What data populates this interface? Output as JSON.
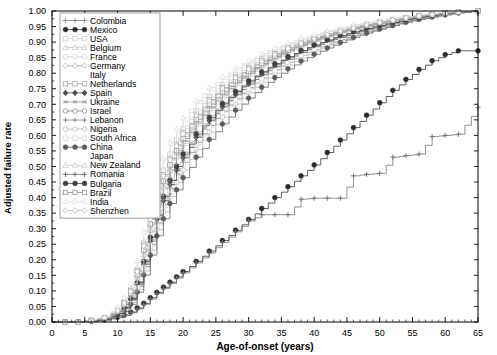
{
  "chart_data": {
    "type": "line",
    "title": "",
    "subtitle": "",
    "xlabel": "Age-of-onset (years)",
    "ylabel": "Adjusted failure rate",
    "xlim": [
      0,
      65
    ],
    "ylim": [
      0.0,
      1.0
    ],
    "xticks": [
      0,
      5,
      10,
      15,
      20,
      25,
      30,
      35,
      40,
      45,
      50,
      55,
      60,
      65
    ],
    "xtick_labels": [
      "0",
      "5",
      "10",
      "15",
      "20",
      "25",
      "30",
      "35",
      "40",
      "45",
      "50",
      "55",
      "60",
      "65"
    ],
    "yticks": [
      0.0,
      0.05,
      0.1,
      0.15,
      0.2,
      0.25,
      0.3,
      0.35,
      0.4,
      0.45,
      0.5,
      0.55,
      0.6,
      0.65,
      0.7,
      0.75,
      0.8,
      0.85,
      0.9,
      0.95,
      1.0
    ],
    "ytick_labels": [
      "0.00",
      "0.05",
      "0.10",
      "0.15",
      "0.20",
      "0.25",
      "0.30",
      "0.35",
      "0.40",
      "0.45",
      "0.50",
      "0.55",
      "0.60",
      "0.65",
      "0.70",
      "0.75",
      "0.80",
      "0.85",
      "0.90",
      "0.95",
      "1.00"
    ],
    "grid": false,
    "minor_ticks": true,
    "legend_position": "upper-left",
    "step_style": "post",
    "x": [
      0,
      2,
      4,
      6,
      8,
      10,
      11,
      12,
      13,
      14,
      15,
      16,
      17,
      18,
      19,
      20,
      22,
      24,
      26,
      28,
      30,
      32,
      34,
      36,
      38,
      40,
      42,
      44,
      46,
      48,
      50,
      52,
      54,
      56,
      58,
      60,
      62,
      65
    ],
    "series": [
      {
        "name": "Colombia",
        "marker": "plus",
        "color": "#8a8a8a",
        "values": [
          0,
          0,
          0,
          0.005,
          0.012,
          0.03,
          0.05,
          0.08,
          0.13,
          0.2,
          0.29,
          0.37,
          0.43,
          0.49,
          0.54,
          0.58,
          0.64,
          0.69,
          0.73,
          0.77,
          0.8,
          0.83,
          0.855,
          0.875,
          0.893,
          0.909,
          0.923,
          0.935,
          0.946,
          0.955,
          0.963,
          0.97,
          0.977,
          0.983,
          0.988,
          0.992,
          0.996,
          1.0
        ]
      },
      {
        "name": "Mexico",
        "marker": "filled-circle",
        "color": "#2b2b2b",
        "values": [
          0,
          0,
          0,
          0.003,
          0.007,
          0.015,
          0.022,
          0.032,
          0.045,
          0.06,
          0.078,
          0.095,
          0.112,
          0.128,
          0.145,
          0.162,
          0.195,
          0.228,
          0.262,
          0.295,
          0.33,
          0.365,
          0.4,
          0.435,
          0.47,
          0.505,
          0.545,
          0.585,
          0.625,
          0.665,
          0.705,
          0.745,
          0.78,
          0.812,
          0.84,
          0.86,
          0.872,
          0.872
        ]
      },
      {
        "name": "USA",
        "marker": "open-square",
        "color": "#c9c9c9",
        "values": [
          0,
          0,
          0,
          0.006,
          0.015,
          0.04,
          0.065,
          0.105,
          0.17,
          0.255,
          0.345,
          0.425,
          0.488,
          0.54,
          0.585,
          0.622,
          0.68,
          0.724,
          0.762,
          0.795,
          0.822,
          0.846,
          0.868,
          0.887,
          0.903,
          0.917,
          0.929,
          0.94,
          0.95,
          0.958,
          0.966,
          0.973,
          0.979,
          0.985,
          0.99,
          0.994,
          0.997,
          1.0
        ]
      },
      {
        "name": "Belgium",
        "marker": "open-triangle",
        "color": "#bdbdbd",
        "values": [
          0,
          0,
          0,
          0.005,
          0.013,
          0.036,
          0.058,
          0.094,
          0.155,
          0.235,
          0.32,
          0.398,
          0.46,
          0.512,
          0.558,
          0.596,
          0.656,
          0.703,
          0.743,
          0.778,
          0.807,
          0.833,
          0.856,
          0.876,
          0.894,
          0.909,
          0.922,
          0.934,
          0.945,
          0.954,
          0.962,
          0.97,
          0.977,
          0.983,
          0.988,
          0.993,
          0.996,
          1.0
        ]
      },
      {
        "name": "France",
        "marker": "open-circle",
        "color": "#cfcfcf",
        "values": [
          0,
          0,
          0,
          0.004,
          0.011,
          0.03,
          0.05,
          0.082,
          0.138,
          0.212,
          0.293,
          0.368,
          0.43,
          0.482,
          0.528,
          0.567,
          0.63,
          0.68,
          0.722,
          0.76,
          0.791,
          0.819,
          0.843,
          0.865,
          0.884,
          0.901,
          0.915,
          0.928,
          0.939,
          0.949,
          0.958,
          0.966,
          0.974,
          0.981,
          0.987,
          0.992,
          0.996,
          1.0
        ]
      },
      {
        "name": "Germany",
        "marker": "open-diamond",
        "color": "#a8a8a8",
        "values": [
          0,
          0,
          0,
          0.005,
          0.013,
          0.033,
          0.055,
          0.09,
          0.148,
          0.225,
          0.308,
          0.384,
          0.446,
          0.498,
          0.544,
          0.583,
          0.644,
          0.693,
          0.734,
          0.77,
          0.8,
          0.827,
          0.85,
          0.871,
          0.889,
          0.905,
          0.919,
          0.931,
          0.942,
          0.952,
          0.96,
          0.968,
          0.975,
          0.982,
          0.988,
          0.993,
          0.996,
          1.0
        ]
      },
      {
        "name": "Italy",
        "marker": "none",
        "color": "#dddddd",
        "values": [
          0,
          0,
          0,
          0.007,
          0.018,
          0.046,
          0.074,
          0.118,
          0.19,
          0.28,
          0.372,
          0.452,
          0.515,
          0.566,
          0.61,
          0.646,
          0.702,
          0.744,
          0.78,
          0.811,
          0.836,
          0.858,
          0.878,
          0.895,
          0.91,
          0.923,
          0.935,
          0.945,
          0.954,
          0.962,
          0.969,
          0.976,
          0.982,
          0.987,
          0.991,
          0.995,
          0.998,
          1.0
        ]
      },
      {
        "name": "Netherlands",
        "marker": "open-square",
        "color": "#9a9a9a",
        "values": [
          0,
          0,
          0,
          0.005,
          0.014,
          0.038,
          0.062,
          0.1,
          0.165,
          0.248,
          0.335,
          0.412,
          0.474,
          0.526,
          0.571,
          0.609,
          0.668,
          0.715,
          0.754,
          0.788,
          0.816,
          0.841,
          0.863,
          0.882,
          0.899,
          0.913,
          0.926,
          0.937,
          0.947,
          0.956,
          0.964,
          0.971,
          0.978,
          0.984,
          0.989,
          0.993,
          0.997,
          1.0
        ]
      },
      {
        "name": "Spain",
        "marker": "filled-diamond",
        "color": "#4a4a4a",
        "values": [
          0,
          0,
          0,
          0.004,
          0.01,
          0.026,
          0.044,
          0.072,
          0.12,
          0.186,
          0.26,
          0.33,
          0.39,
          0.442,
          0.488,
          0.528,
          0.594,
          0.647,
          0.692,
          0.731,
          0.765,
          0.795,
          0.821,
          0.845,
          0.866,
          0.885,
          0.901,
          0.915,
          0.928,
          0.939,
          0.95,
          0.959,
          0.968,
          0.976,
          0.983,
          0.989,
          0.995,
          1.0
        ]
      },
      {
        "name": "Ukraine",
        "marker": "asterisk",
        "color": "#909090",
        "values": [
          0,
          0,
          0,
          0.004,
          0.011,
          0.028,
          0.047,
          0.077,
          0.128,
          0.197,
          0.275,
          0.347,
          0.408,
          0.46,
          0.506,
          0.546,
          0.611,
          0.663,
          0.707,
          0.745,
          0.778,
          0.806,
          0.831,
          0.853,
          0.873,
          0.891,
          0.906,
          0.92,
          0.932,
          0.943,
          0.953,
          0.962,
          0.971,
          0.979,
          0.985,
          0.991,
          0.996,
          1.0
        ]
      },
      {
        "name": "Israel",
        "marker": "open-circle",
        "color": "#7d7d7d",
        "values": [
          0,
          0,
          0,
          0.004,
          0.01,
          0.025,
          0.042,
          0.069,
          0.115,
          0.178,
          0.25,
          0.318,
          0.377,
          0.428,
          0.473,
          0.513,
          0.578,
          0.632,
          0.678,
          0.718,
          0.753,
          0.784,
          0.811,
          0.835,
          0.857,
          0.876,
          0.893,
          0.908,
          0.922,
          0.934,
          0.945,
          0.955,
          0.965,
          0.974,
          0.981,
          0.988,
          0.994,
          1.0
        ]
      },
      {
        "name": "Lebanon",
        "marker": "plus",
        "color": "#8e8e8e",
        "values": [
          0,
          0,
          0,
          0.004,
          0.011,
          0.027,
          0.045,
          0.074,
          0.123,
          0.19,
          0.266,
          0.336,
          0.396,
          0.448,
          0.494,
          0.534,
          0.598,
          0.652,
          0.698,
          0.737,
          0.771,
          0.801,
          0.827,
          0.85,
          0.871,
          0.889,
          0.905,
          0.919,
          0.932,
          0.943,
          0.953,
          0.962,
          0.971,
          0.979,
          0.986,
          0.991,
          0.996,
          1.0
        ]
      },
      {
        "name": "Nigeria",
        "marker": "open-circle",
        "color": "#b5b5b5",
        "values": [
          0,
          0,
          0,
          0.003,
          0.009,
          0.022,
          0.038,
          0.063,
          0.105,
          0.164,
          0.232,
          0.297,
          0.354,
          0.404,
          0.449,
          0.489,
          0.555,
          0.611,
          0.659,
          0.701,
          0.738,
          0.771,
          0.8,
          0.826,
          0.849,
          0.87,
          0.888,
          0.904,
          0.919,
          0.932,
          0.943,
          0.954,
          0.964,
          0.973,
          0.981,
          0.988,
          0.994,
          1.0
        ]
      },
      {
        "name": "South Africa",
        "marker": "open-square",
        "color": "#d4d4d4",
        "values": [
          0,
          0,
          0,
          0.004,
          0.01,
          0.024,
          0.041,
          0.067,
          0.112,
          0.174,
          0.244,
          0.311,
          0.369,
          0.42,
          0.465,
          0.505,
          0.571,
          0.626,
          0.673,
          0.714,
          0.75,
          0.782,
          0.81,
          0.835,
          0.857,
          0.877,
          0.894,
          0.91,
          0.924,
          0.936,
          0.947,
          0.957,
          0.967,
          0.975,
          0.982,
          0.989,
          0.995,
          1.0
        ]
      },
      {
        "name": "China",
        "marker": "filled-circle",
        "color": "#5c5c5c",
        "values": [
          0,
          0,
          0,
          0.003,
          0.008,
          0.02,
          0.034,
          0.057,
          0.096,
          0.151,
          0.215,
          0.277,
          0.332,
          0.381,
          0.425,
          0.464,
          0.53,
          0.587,
          0.637,
          0.681,
          0.72,
          0.755,
          0.786,
          0.814,
          0.839,
          0.861,
          0.881,
          0.899,
          0.915,
          0.929,
          0.942,
          0.953,
          0.964,
          0.973,
          0.981,
          0.988,
          0.994,
          1.0
        ]
      },
      {
        "name": "Japan",
        "marker": "none",
        "color": "#e0e0e0",
        "values": [
          0,
          0,
          0,
          0.006,
          0.016,
          0.042,
          0.068,
          0.11,
          0.178,
          0.264,
          0.354,
          0.433,
          0.496,
          0.548,
          0.593,
          0.63,
          0.688,
          0.733,
          0.771,
          0.803,
          0.83,
          0.854,
          0.874,
          0.892,
          0.908,
          0.922,
          0.934,
          0.945,
          0.954,
          0.963,
          0.97,
          0.977,
          0.983,
          0.988,
          0.992,
          0.996,
          0.998,
          1.0
        ]
      },
      {
        "name": "New Zealand",
        "marker": "open-triangle",
        "color": "#c2c2c2",
        "values": [
          0,
          0,
          0,
          0.005,
          0.012,
          0.031,
          0.052,
          0.085,
          0.142,
          0.217,
          0.299,
          0.375,
          0.437,
          0.489,
          0.535,
          0.574,
          0.637,
          0.687,
          0.729,
          0.766,
          0.797,
          0.824,
          0.848,
          0.869,
          0.888,
          0.904,
          0.918,
          0.931,
          0.942,
          0.952,
          0.961,
          0.969,
          0.976,
          0.983,
          0.988,
          0.993,
          0.997,
          1.0
        ]
      },
      {
        "name": "Romania",
        "marker": "plus",
        "color": "#6f6f6f",
        "values": [
          0,
          0,
          0,
          0.002,
          0.006,
          0.014,
          0.021,
          0.03,
          0.042,
          0.057,
          0.074,
          0.091,
          0.108,
          0.124,
          0.141,
          0.158,
          0.19,
          0.222,
          0.256,
          0.29,
          0.325,
          0.345,
          0.345,
          0.345,
          0.395,
          0.398,
          0.398,
          0.398,
          0.47,
          0.475,
          0.478,
          0.53,
          0.535,
          0.54,
          0.596,
          0.6,
          0.604,
          0.69
        ]
      },
      {
        "name": "Bulgaria",
        "marker": "filled-circle",
        "color": "#3f3f3f",
        "values": [
          0,
          0,
          0,
          0.004,
          0.01,
          0.027,
          0.046,
          0.075,
          0.126,
          0.195,
          0.272,
          0.343,
          0.403,
          0.455,
          0.5,
          0.54,
          0.604,
          0.657,
          0.702,
          0.741,
          0.775,
          0.804,
          0.83,
          0.853,
          0.873,
          0.891,
          0.907,
          0.921,
          0.933,
          0.944,
          0.954,
          0.963,
          0.972,
          0.98,
          0.986,
          0.992,
          0.996,
          1.0
        ]
      },
      {
        "name": "Brazil",
        "marker": "open-square",
        "color": "#8f8f8f",
        "values": [
          0,
          0,
          0,
          0.005,
          0.013,
          0.034,
          0.057,
          0.092,
          0.152,
          0.231,
          0.315,
          0.391,
          0.453,
          0.505,
          0.551,
          0.59,
          0.651,
          0.7,
          0.74,
          0.775,
          0.805,
          0.831,
          0.854,
          0.874,
          0.892,
          0.908,
          0.921,
          0.933,
          0.944,
          0.953,
          0.962,
          0.969,
          0.976,
          0.983,
          0.988,
          0.993,
          0.997,
          1.0
        ]
      },
      {
        "name": "India",
        "marker": "open-triangle",
        "color": "#dcdcdc",
        "values": [
          0,
          0,
          0,
          0.007,
          0.018,
          0.048,
          0.078,
          0.124,
          0.198,
          0.291,
          0.384,
          0.464,
          0.527,
          0.578,
          0.621,
          0.657,
          0.712,
          0.754,
          0.789,
          0.818,
          0.842,
          0.863,
          0.882,
          0.898,
          0.913,
          0.925,
          0.936,
          0.946,
          0.955,
          0.963,
          0.97,
          0.977,
          0.983,
          0.988,
          0.992,
          0.996,
          0.998,
          1.0
        ]
      },
      {
        "name": "Shenzhen",
        "marker": "open-diamond",
        "color": "#b0b0b0",
        "values": [
          0,
          0,
          0,
          0.005,
          0.014,
          0.037,
          0.061,
          0.098,
          0.162,
          0.244,
          0.33,
          0.407,
          0.469,
          0.521,
          0.566,
          0.604,
          0.664,
          0.711,
          0.751,
          0.785,
          0.813,
          0.838,
          0.86,
          0.879,
          0.896,
          0.911,
          0.924,
          0.935,
          0.945,
          0.955,
          0.963,
          0.971,
          0.978,
          0.984,
          0.989,
          0.994,
          0.997,
          1.0
        ]
      }
    ]
  },
  "legend": {
    "items": [
      {
        "label": "Colombia"
      },
      {
        "label": "Mexico"
      },
      {
        "label": "USA"
      },
      {
        "label": "Belgium"
      },
      {
        "label": "France"
      },
      {
        "label": "Germany"
      },
      {
        "label": "Italy"
      },
      {
        "label": "Netherlands"
      },
      {
        "label": "Spain"
      },
      {
        "label": "Ukraine"
      },
      {
        "label": "Israel"
      },
      {
        "label": "Lebanon"
      },
      {
        "label": "Nigeria"
      },
      {
        "label": "South Africa"
      },
      {
        "label": "China"
      },
      {
        "label": "Japan"
      },
      {
        "label": "New Zealand"
      },
      {
        "label": "Romania"
      },
      {
        "label": "Bulgaria"
      },
      {
        "label": "Brazil"
      },
      {
        "label": "India"
      },
      {
        "label": "Shenzhen"
      }
    ]
  },
  "style": {
    "axis_color": "#000000",
    "background": "#ffffff",
    "legend_border": "#888888"
  }
}
